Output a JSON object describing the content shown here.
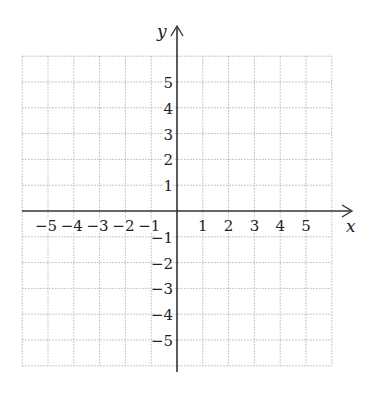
{
  "figure": {
    "type": "coordinate-plane",
    "x_axis_label": "x",
    "y_axis_label": "y",
    "x_range": [
      -6,
      6
    ],
    "y_range": [
      -6,
      6
    ],
    "grid": {
      "style": "dotted",
      "color": "#b5b5b5",
      "step": 1
    },
    "axis_color": "#333333",
    "x_ticks": [
      {
        "value": -5,
        "label": "−5"
      },
      {
        "value": -4,
        "label": "−4"
      },
      {
        "value": -3,
        "label": "−3"
      },
      {
        "value": -2,
        "label": "−2"
      },
      {
        "value": -1,
        "label": "−1"
      },
      {
        "value": 1,
        "label": "1"
      },
      {
        "value": 2,
        "label": "2"
      },
      {
        "value": 3,
        "label": "3"
      },
      {
        "value": 4,
        "label": "4"
      },
      {
        "value": 5,
        "label": "5"
      }
    ],
    "y_ticks": [
      {
        "value": 5,
        "label": "5"
      },
      {
        "value": 4,
        "label": "4"
      },
      {
        "value": 3,
        "label": "3"
      },
      {
        "value": 2,
        "label": "2"
      },
      {
        "value": 1,
        "label": "1"
      },
      {
        "value": -1,
        "label": "−1"
      },
      {
        "value": -2,
        "label": "−2"
      },
      {
        "value": -3,
        "label": "−3"
      },
      {
        "value": -4,
        "label": "−4"
      },
      {
        "value": -5,
        "label": "−5"
      }
    ]
  }
}
